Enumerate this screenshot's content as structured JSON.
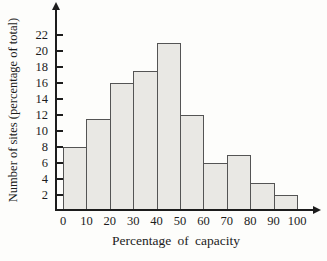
{
  "figure": {
    "background": "#fdfdfb"
  },
  "chart_data": {
    "type": "bar",
    "subtype": "histogram",
    "title": "",
    "xlabel": "Percentage of capacity",
    "ylabel": "Number of sites (percentage of total)",
    "bin_edges": [
      0,
      10,
      20,
      30,
      40,
      50,
      60,
      70,
      80,
      90,
      100
    ],
    "values": [
      8,
      11.5,
      16,
      17.5,
      21,
      12,
      6,
      7,
      3.5,
      2
    ],
    "yticks": [
      2,
      4,
      6,
      8,
      10,
      12,
      14,
      16,
      18,
      20,
      22
    ],
    "xticks": [
      0,
      10,
      20,
      30,
      40,
      50,
      60,
      70,
      80,
      90,
      100
    ],
    "ylim": [
      0,
      25
    ],
    "xlim": [
      0,
      107
    ],
    "grid": false,
    "legend": null,
    "colors": {
      "bar_fill": "#e9e8e4",
      "bar_border": "#545454",
      "axis": "#1c1c1c",
      "text": "#1c1c1c",
      "background": "#fdfdfb"
    }
  }
}
